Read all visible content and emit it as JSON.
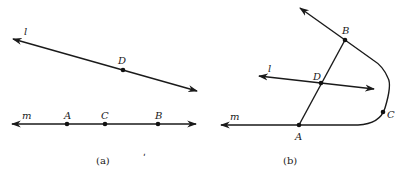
{
  "figure_a": {
    "caption": "(a)",
    "line_l": {
      "label": "l",
      "points": [
        {
          "name": "D",
          "label": "D"
        }
      ]
    },
    "line_m": {
      "label": "m",
      "points": [
        {
          "name": "A",
          "label": "A"
        },
        {
          "name": "C",
          "label": "C"
        },
        {
          "name": "B",
          "label": "B"
        }
      ]
    }
  },
  "figure_b": {
    "caption": "(b)",
    "line_l_label": "l",
    "line_m_label": "m",
    "points": {
      "A": "A",
      "B": "B",
      "C": "C",
      "D": "D"
    }
  },
  "stray_mark": "ʹ",
  "colors": {
    "ink": "#1a1a1a",
    "background": "#ffffff"
  }
}
